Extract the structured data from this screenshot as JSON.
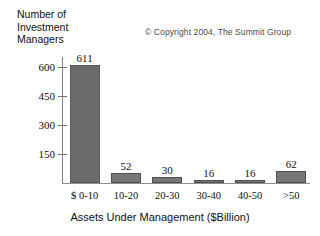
{
  "chart_data": {
    "type": "bar",
    "title": "",
    "categories": [
      "$ 0-10",
      "10-20",
      "20-30",
      "30-40",
      "40-50",
      ">50"
    ],
    "values": [
      611,
      52,
      30,
      16,
      16,
      62
    ],
    "xlabel": "Assets Under Management ($Billion)",
    "ylabel": "Number of\nInvestment\nManagers",
    "ylim": [
      0,
      650
    ],
    "yticks": [
      150,
      300,
      450,
      600
    ],
    "ytick_labels": [
      "150",
      "300",
      "450",
      "600"
    ],
    "data_labels": [
      "611",
      "52",
      "30",
      "16",
      "16",
      "62"
    ],
    "grid": false,
    "legend": false,
    "annotations": [
      {
        "name": "copyright",
        "text": "© Copyright 2004, The Summit Group"
      }
    ],
    "colors": {
      "bar_fill": "#6b6b6b",
      "bar_edge": "#5a5a5a",
      "axis": "#808080",
      "text": "#101010",
      "background": "#ffffff"
    }
  }
}
